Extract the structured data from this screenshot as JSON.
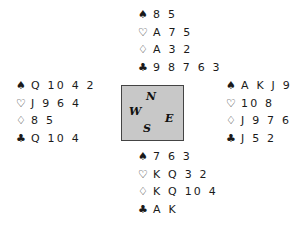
{
  "suits": {
    "spades": "♠",
    "hearts": "♡",
    "diamonds": "♢",
    "clubs": "♣"
  },
  "hands": {
    "north": {
      "spades": "8 5",
      "hearts": "A 7 5",
      "diamonds": "A 3 2",
      "clubs": "9 8 7 6 3"
    },
    "west": {
      "spades": "Q 10 4 2",
      "hearts": "J 9 6 4",
      "diamonds": "8 5",
      "clubs": "Q 10 4"
    },
    "east": {
      "spades": "A K J 9",
      "hearts": "10 8",
      "diamonds": "J 9 7 6",
      "clubs": "J 5 2"
    },
    "south": {
      "spades": "7 6 3",
      "hearts": "K Q 3 2",
      "diamonds": "K Q 10 4",
      "clubs": "A K"
    }
  },
  "compass": {
    "north": "N",
    "west": "W",
    "east": "E",
    "south": "S"
  }
}
